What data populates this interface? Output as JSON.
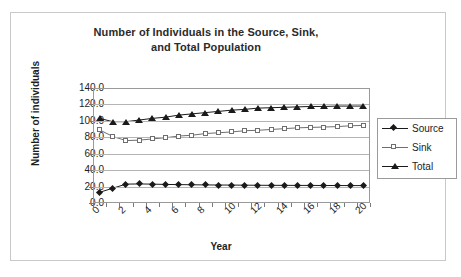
{
  "chart_data": {
    "type": "line",
    "title": "Number of Individuals in the Source, Sink, and Total Population",
    "title_line1": "Number of Individuals in the Source, Sink,",
    "title_line2": "and Total Population",
    "xlabel": "Year",
    "ylabel": "Number of individuals",
    "xlim": [
      0,
      21
    ],
    "ylim": [
      0,
      140
    ],
    "grid": true,
    "legend_position": "right",
    "ytick_labels": [
      "140.0",
      "120.0",
      "100.0",
      "80.0",
      "60.0",
      "40.0",
      "20.0",
      "0.0"
    ],
    "ytick_values": [
      140,
      120,
      100,
      80,
      60,
      40,
      20,
      0
    ],
    "xtick_labels": [
      "0",
      "2",
      "4",
      "6",
      "8",
      "10",
      "12",
      "14",
      "16",
      "18",
      "20"
    ],
    "xtick_values": [
      0,
      2,
      4,
      6,
      8,
      10,
      12,
      14,
      16,
      18,
      20
    ],
    "x": [
      0,
      1,
      2,
      3,
      4,
      5,
      6,
      7,
      8,
      9,
      10,
      11,
      12,
      13,
      14,
      15,
      16,
      17,
      18,
      19,
      20
    ],
    "series": [
      {
        "name": "Source",
        "marker": "filled-diamond",
        "color": "#1a1a1a",
        "values": [
          13.0,
          18.0,
          23.0,
          23.2,
          23.0,
          22.6,
          22.4,
          22.2,
          22.0,
          21.9,
          21.8,
          21.7,
          21.6,
          21.5,
          21.5,
          21.4,
          21.4,
          21.3,
          21.3,
          21.2,
          21.2
        ]
      },
      {
        "name": "Sink",
        "marker": "open-square",
        "color": "#6e6e6e",
        "values": [
          89.0,
          81.0,
          76.0,
          76.5,
          78.0,
          79.5,
          81.5,
          82.5,
          84.5,
          85.5,
          86.5,
          88.0,
          88.5,
          89.5,
          90.5,
          91.5,
          92.0,
          92.5,
          93.0,
          94.0,
          94.5
        ]
      },
      {
        "name": "Total",
        "marker": "filled-triangle",
        "color": "#1a1a1a",
        "values": [
          103.0,
          99.0,
          99.0,
          101.0,
          103.0,
          104.5,
          107.0,
          108.5,
          110.0,
          111.5,
          113.0,
          114.0,
          115.5,
          116.0,
          116.5,
          117.0,
          117.5,
          117.5,
          118.0,
          118.0,
          118.0
        ]
      }
    ]
  }
}
